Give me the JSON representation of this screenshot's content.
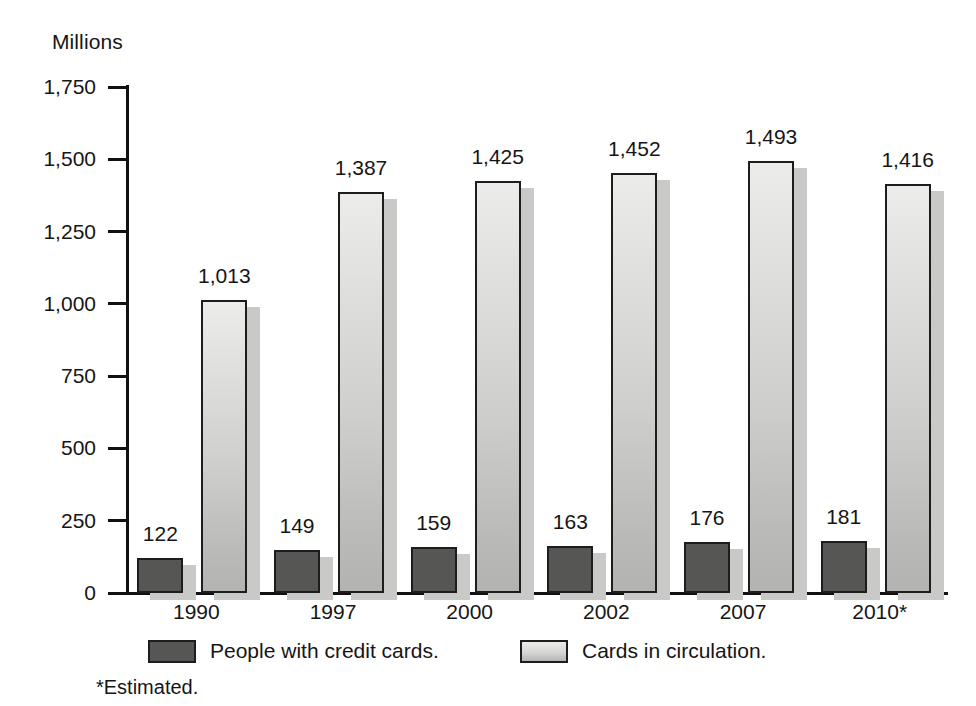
{
  "chart_data": {
    "type": "bar",
    "title": "",
    "ylabel": "Millions",
    "xlabel": "",
    "ylim": [
      0,
      1750
    ],
    "yticks": [
      0,
      250,
      500,
      750,
      1000,
      1250,
      1500,
      1750
    ],
    "ytick_labels": [
      "0",
      "250",
      "500",
      "750",
      "1,000",
      "1,250",
      "1,500",
      "1,750"
    ],
    "grid": false,
    "legend_position": "bottom",
    "categories": [
      "1990",
      "1997",
      "2000",
      "2002",
      "2007",
      "2010*"
    ],
    "series": [
      {
        "name": "People with credit cards.",
        "color": "#565654",
        "values": [
          122,
          149,
          159,
          163,
          176,
          181
        ],
        "value_labels": [
          "122",
          "149",
          "159",
          "163",
          "176",
          "181"
        ]
      },
      {
        "name": "Cards in circulation.",
        "color": "#d5d5d3",
        "values": [
          1013,
          1387,
          1425,
          1452,
          1493,
          1416
        ],
        "value_labels": [
          "1,013",
          "1,387",
          "1,425",
          "1,452",
          "1,493",
          "1,416"
        ]
      }
    ],
    "annotations": [
      "*Estimated."
    ]
  },
  "axis": {
    "y_title": "Millions"
  },
  "footnote": "*Estimated."
}
